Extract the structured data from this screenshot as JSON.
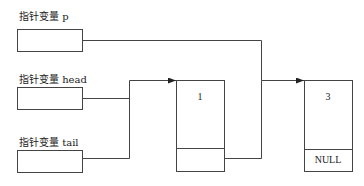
{
  "pointers": [
    {
      "label": "指针变量 p"
    },
    {
      "label": "指针变量 head"
    },
    {
      "label": "指针变量 tail"
    }
  ],
  "nodes": [
    {
      "data": "1",
      "next": ""
    },
    {
      "data": "3",
      "next": "NULL"
    }
  ],
  "colors": {
    "line": "#444444",
    "background": "#ffffff"
  }
}
